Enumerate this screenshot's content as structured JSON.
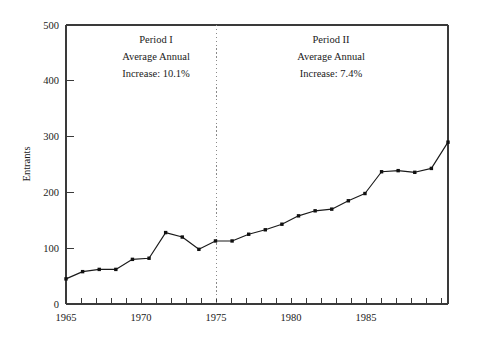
{
  "chart_data": {
    "type": "line",
    "title": "",
    "subtitle": "",
    "xlabel": "",
    "ylabel": "Entrants",
    "xlim": [
      1964.5,
      1990.5
    ],
    "ylim": [
      0,
      500
    ],
    "grid": false,
    "legend": false,
    "legend_position": "none",
    "x": [
      1965,
      1966,
      1967,
      1968,
      1969,
      1970,
      1971,
      1972,
      1973,
      1974,
      1975,
      1976,
      1977,
      1978,
      1979,
      1980,
      1981,
      1982,
      1983,
      1984,
      1985,
      1986,
      1987,
      1988
    ],
    "values": [
      45,
      58,
      62,
      62,
      80,
      82,
      128,
      120,
      98,
      113,
      113,
      125,
      133,
      143,
      158,
      167,
      170,
      185,
      198,
      237,
      239,
      236,
      243,
      290
    ],
    "series": [
      {
        "name": "Entrants",
        "values": [
          45,
          58,
          62,
          62,
          80,
          82,
          128,
          120,
          98,
          113,
          113,
          125,
          133,
          143,
          158,
          167,
          170,
          185,
          198,
          237,
          239,
          236,
          243,
          290
        ],
        "color": "#111111",
        "marker": "square"
      }
    ],
    "y_ticks": [
      0,
      100,
      200,
      300,
      400,
      500
    ],
    "y_tick_labels": [
      "0",
      "100",
      "200",
      "300",
      "400",
      "500"
    ],
    "x_ticks": [
      1965,
      1966,
      1967,
      1968,
      1969,
      1970,
      1971,
      1972,
      1973,
      1974,
      1975,
      1976,
      1977,
      1978,
      1979,
      1980,
      1981,
      1982,
      1983,
      1984,
      1985,
      1986,
      1987,
      1988,
      1989,
      1990
    ],
    "x_tick_labels_major": [
      {
        "value": 1965,
        "label": "1965"
      },
      {
        "value": 1970,
        "label": "1970"
      },
      {
        "value": 1975,
        "label": "1975"
      },
      {
        "value": 1980,
        "label": "1980"
      },
      {
        "value": 1985,
        "label": "1985"
      }
    ],
    "annotations": [
      {
        "id": "period-1",
        "x": 1970,
        "y": 455,
        "lines": [
          "Period I",
          "Average Annual",
          "Increase: 10.1%"
        ]
      },
      {
        "id": "period-2",
        "x": 1981,
        "y": 455,
        "lines": [
          "Period II",
          "Average Annual",
          "Increase: 7.4%"
        ]
      }
    ],
    "vertical_divider": {
      "x": 1975,
      "style": "dotted",
      "color": "#8a8a8a"
    }
  },
  "annotation_period1": {
    "line1": "Period I",
    "line2": "Average Annual",
    "line3": "Increase: 10.1%"
  },
  "annotation_period2": {
    "line1": "Period II",
    "line2": "Average Annual",
    "line3": "Increase: 7.4%"
  },
  "axes": {
    "ylabel": "Entrants",
    "y_labels": {
      "t0": "0",
      "t100": "100",
      "t200": "200",
      "t300": "300",
      "t400": "400",
      "t500": "500"
    },
    "x_labels": {
      "t1965": "1965",
      "t1970": "1970",
      "t1975": "1975",
      "t1980": "1980",
      "t1985": "1985"
    }
  },
  "colors": {
    "background": "#ffffff",
    "axis": "#3a3a3a",
    "series": "#111111",
    "divider": "#8a8a8a",
    "text": "#1a1a1a"
  }
}
